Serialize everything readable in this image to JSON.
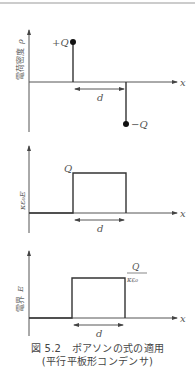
{
  "figure": {
    "caption_line1": "図 5.2　ポアソンの式の適用",
    "caption_line2": "(平行平板形コンデンサ)"
  },
  "panels": [
    {
      "id": "charge-density",
      "ylabel_jp": "電荷密度",
      "ylabel_sym": "ρ",
      "xlabel": "x",
      "distance_label": "d",
      "pos_charge_label": "+Q",
      "neg_charge_label": "−Q"
    },
    {
      "id": "displacement",
      "ylabel_sym": "κε₀E",
      "xlabel": "x",
      "distance_label": "d",
      "level_label": "Q"
    },
    {
      "id": "electric-field",
      "ylabel_jp": "電界",
      "ylabel_sym": "E",
      "xlabel": "x",
      "distance_label": "d",
      "level_num": "Q",
      "level_den": "κε₀"
    }
  ],
  "colors": {
    "line": "#333333",
    "axis": "#555555",
    "text": "#555555"
  }
}
